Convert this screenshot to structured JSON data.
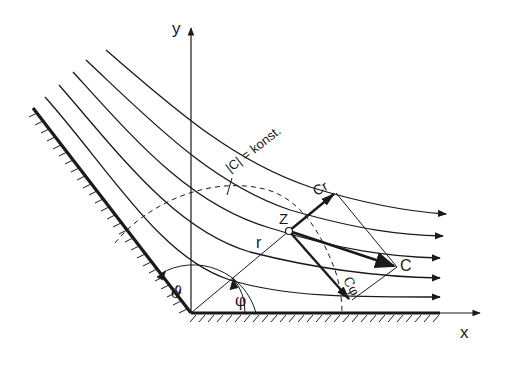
{
  "diagram": {
    "type": "flow-around-corner",
    "labels": {
      "x_axis": "x",
      "y_axis": "y",
      "velocity_magnitude": "|C| = konst.",
      "point": "Z",
      "radius": "r",
      "angle_phi": "φ",
      "angle_theta": "ϑ",
      "velocity": "C",
      "radial_component": "Cr",
      "tangential_component": "Cφ"
    },
    "elements": {
      "walls": [
        "inclined-wall",
        "horizontal-wall"
      ],
      "streamlines_count": 5,
      "dashed_arc": "constant-velocity-line",
      "vectors": [
        "C",
        "Cr",
        "Cφ"
      ]
    },
    "colors": {
      "ink": "#1a1a1a",
      "background": "#ffffff"
    }
  }
}
